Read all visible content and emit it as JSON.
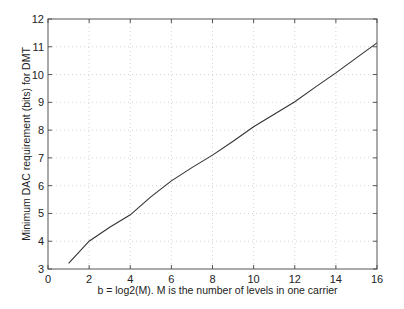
{
  "chart_data": {
    "type": "line",
    "title": "",
    "xlabel": "b = log2(M). M is the number of levels in one carrier",
    "ylabel": "Minimum DAC requirement (bits) for DMT",
    "xlim": [
      0,
      16
    ],
    "ylim": [
      3,
      12
    ],
    "xticks": [
      0,
      2,
      4,
      6,
      8,
      10,
      12,
      14,
      16
    ],
    "yticks": [
      3,
      4,
      5,
      6,
      7,
      8,
      9,
      10,
      11,
      12
    ],
    "grid": true,
    "legend": null,
    "series": [
      {
        "name": "Minimum DAC requirement",
        "color": "#333333",
        "x": [
          1,
          2,
          3,
          4,
          5,
          6,
          7,
          8,
          9,
          10,
          11,
          12,
          13,
          14,
          15,
          16
        ],
        "y": [
          3.2,
          4.0,
          4.5,
          4.95,
          5.6,
          6.17,
          6.65,
          7.1,
          7.6,
          8.12,
          8.57,
          9.02,
          9.55,
          10.06,
          10.6,
          11.14
        ]
      }
    ]
  },
  "labels": {
    "xlabel": "b = log2(M). M is the number of levels in one carrier",
    "ylabel": "Minimum DAC requirement (bits) for DMT"
  }
}
